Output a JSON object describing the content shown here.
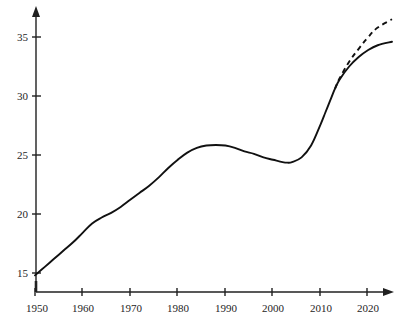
{
  "chart_data": {
    "type": "line",
    "title": "",
    "subtitle": "",
    "xlabel": "",
    "ylabel": "",
    "xlim": [
      1950,
      2025
    ],
    "ylim": [
      13.8,
      37.0
    ],
    "grid": false,
    "legend": "none",
    "y_ticks": [
      15,
      20,
      25,
      30,
      35
    ],
    "y_tick_labels": [
      "15",
      "20",
      "25",
      "30",
      "35"
    ],
    "x_ticks": [
      1950,
      1960,
      1970,
      1980,
      1990,
      2000,
      2010,
      2020
    ],
    "x_tick_labels": [
      "1950",
      "1960",
      "1970",
      "1980",
      "1990",
      "2000",
      "2010",
      "2020"
    ],
    "axis_color": "#202020",
    "series": [
      {
        "name": "observed",
        "style": "solid",
        "color": "#111111",
        "x": [
          1950,
          1952,
          1954,
          1956,
          1958,
          1960,
          1962,
          1964,
          1966,
          1968,
          1970,
          1972,
          1974,
          1976,
          1978,
          1980,
          1982,
          1984,
          1986,
          1988,
          1990,
          1992,
          1994,
          1996,
          1998,
          2000,
          2002,
          2003,
          2004,
          2006,
          2008,
          2010,
          2011,
          2012,
          2013,
          2014,
          2016,
          2018,
          2020,
          2022,
          2025
        ],
        "values": [
          14.8,
          15.5,
          16.2,
          16.9,
          17.6,
          18.4,
          19.2,
          19.7,
          20.1,
          20.6,
          21.2,
          21.8,
          22.4,
          23.1,
          23.9,
          24.6,
          25.2,
          25.6,
          25.8,
          25.85,
          25.8,
          25.6,
          25.3,
          25.1,
          24.8,
          24.6,
          24.4,
          24.35,
          24.4,
          24.8,
          25.8,
          27.6,
          28.6,
          29.6,
          30.6,
          31.4,
          32.5,
          33.3,
          33.9,
          34.3,
          34.6
        ]
      },
      {
        "name": "projection",
        "style": "dashed",
        "color": "#111111",
        "x": [
          2013,
          2014,
          2016,
          2018,
          2020,
          2022,
          2025
        ],
        "values": [
          30.6,
          31.5,
          32.9,
          34.0,
          35.0,
          35.8,
          36.5
        ]
      }
    ],
    "annotations": [
      {
        "name": "branch-point",
        "x": 2013,
        "y": 30.6,
        "note": "solid and dashed curves diverge"
      },
      {
        "name": "plateau-peak",
        "x": 1989,
        "y": 25.85,
        "note": "local maximum"
      },
      {
        "name": "trough",
        "x": 2003,
        "y": 24.35,
        "note": "local minimum"
      }
    ]
  }
}
